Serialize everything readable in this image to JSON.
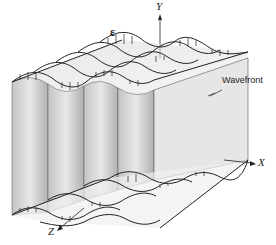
{
  "figure": {
    "labels": {
      "y_axis": "Y",
      "x_axis": "X",
      "z_axis": "Z",
      "field": "ε",
      "wavefront": "Wavefront"
    },
    "colors": {
      "panel_light": "#e4e4e4",
      "panel_dark": "#b8b8b8",
      "line": "#222222",
      "background": "#ffffff"
    },
    "panel_count": 5,
    "wave_rows_top": 4,
    "wave_rows_bottom": 4
  }
}
